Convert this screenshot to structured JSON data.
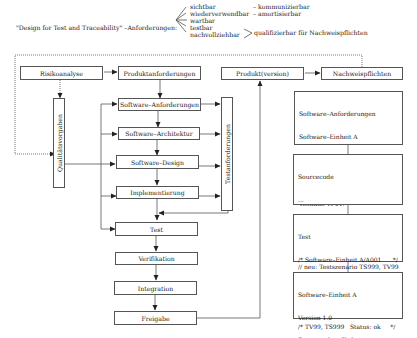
{
  "header": {
    "title": "\"Design for Test and Traceability\" –Anforderungen:",
    "properties_left": [
      "sichtbar",
      "wiederverwendbar",
      "wartbar",
      "testbar",
      "nachvollziehbar"
    ],
    "properties_right": [
      "– kommunizierbar",
      "– amortisierbar"
    ],
    "grouped_property": "qualifizierbar für Nachweispflichten"
  },
  "nodes": {
    "risikoanalyse": "Risikoanalyse",
    "produktanforderungen": "Produktanforderungen",
    "software_anforderungen": "Software–Anforderungen",
    "software_architektur": "Software–Architektur",
    "software_design": "Software–Design",
    "implementierung": "Implementierung",
    "test": "Test",
    "verifikation": "Verifikation",
    "integration": "Integration",
    "freigabe": "Freigabe",
    "qualitaetsvorgaben": "Qualitätsvorgaben",
    "testanforderungen": "Testanforderungen",
    "produktversion": "Produkt(version)",
    "nachweispflichten": "Nachweispflichten"
  },
  "code_boxes": [
    {
      "name": "requirements-doc",
      "lines": [
        "Software–Anforderungen",
        "Software–Einheit A",
        "Anforderung A001: ...",
        "Testverfahren TV01:",
        "Testfälle TF01:"
      ]
    },
    {
      "name": "sourcecode-doc",
      "lines": [
        "Sourcecode",
        "...",
        "/* Software–Einheit A/A001      */",
        "...",
        "// neu: Testszenario TS999, TV99"
      ]
    },
    {
      "name": "test-doc",
      "lines": [
        "Test",
        "/* Software–Einheit A/A001      */",
        "/* TV01, TF01    Status: ok     */",
        "...",
        "/* TV99, TS999   Status: ok     */"
      ]
    },
    {
      "name": "unit-doc",
      "lines": [
        "Software–Einheit A",
        "Version 1.0",
        "Sourcecodes: file0xx.c, ...",
        "Test: ...",
        "Anforderungen: ..."
      ]
    }
  ],
  "colors": {
    "line": "#555555",
    "text": "#222222",
    "background": "#ffffff"
  }
}
